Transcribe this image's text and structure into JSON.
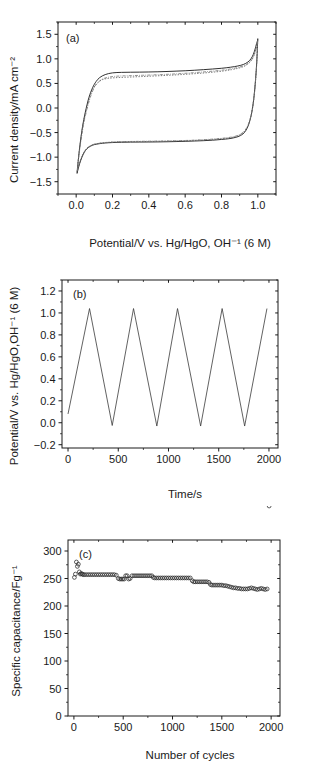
{
  "figure": {
    "background_color": "#ffffff",
    "line_color": "#1a1a1a"
  },
  "panels": [
    {
      "tag": "(a)",
      "id": "panel-a"
    },
    {
      "tag": "(b)",
      "id": "panel-b"
    },
    {
      "tag": "(c)",
      "id": "panel-c"
    }
  ],
  "chart_data": [
    {
      "type": "line",
      "panel": "(a)",
      "title": "",
      "xlabel": "Potential/V vs. Hg/HgO, OH⁻¹ (6 M)",
      "ylabel": "Current density/mA cm⁻²",
      "xlim": [
        -0.1,
        1.1
      ],
      "ylim": [
        -1.75,
        1.75
      ],
      "xticks": [
        0.0,
        0.2,
        0.4,
        0.6,
        0.8,
        1.0
      ],
      "xtick_labels": [
        "0.0",
        "0.2",
        "0.4",
        "0.6",
        "0.8",
        "1.0"
      ],
      "yticks": [
        -1.5,
        -1.0,
        -0.5,
        0.0,
        0.5,
        1.0,
        1.5
      ],
      "ytick_labels": [
        "−1.5",
        "−1.0",
        "−0.5",
        "0.0",
        "0.5",
        "1.0",
        "1.5"
      ],
      "grid": false,
      "legend": "none",
      "series": [
        {
          "name": "cv-cycle-1",
          "style": "solid",
          "upper_branch": {
            "x": [
              0.005,
              0.012,
              0.022,
              0.035,
              0.05,
              0.07,
              0.09,
              0.11,
              0.13,
              0.16,
              0.2,
              0.25,
              0.3,
              0.35,
              0.4,
              0.45,
              0.5,
              0.55,
              0.6,
              0.65,
              0.7,
              0.75,
              0.8,
              0.85,
              0.89,
              0.92,
              0.945,
              0.962,
              0.975,
              0.985,
              0.993,
              0.999
            ],
            "y": [
              -1.33,
              -1.05,
              -0.72,
              -0.38,
              -0.09,
              0.21,
              0.41,
              0.54,
              0.62,
              0.68,
              0.715,
              0.725,
              0.728,
              0.73,
              0.733,
              0.737,
              0.743,
              0.75,
              0.758,
              0.768,
              0.78,
              0.793,
              0.808,
              0.83,
              0.855,
              0.885,
              0.935,
              1.0,
              1.09,
              1.2,
              1.31,
              1.38
            ]
          },
          "lower_branch": {
            "x": [
              0.999,
              0.995,
              0.988,
              0.978,
              0.966,
              0.95,
              0.93,
              0.905,
              0.875,
              0.84,
              0.8,
              0.75,
              0.7,
              0.65,
              0.6,
              0.55,
              0.5,
              0.45,
              0.4,
              0.35,
              0.3,
              0.25,
              0.2,
              0.16,
              0.13,
              0.1,
              0.08,
              0.06,
              0.045,
              0.032,
              0.02,
              0.011,
              0.005
            ],
            "y": [
              1.38,
              1.0,
              0.6,
              0.2,
              -0.1,
              -0.33,
              -0.48,
              -0.56,
              -0.6,
              -0.625,
              -0.64,
              -0.655,
              -0.665,
              -0.672,
              -0.678,
              -0.683,
              -0.687,
              -0.69,
              -0.692,
              -0.693,
              -0.694,
              -0.697,
              -0.703,
              -0.712,
              -0.725,
              -0.745,
              -0.775,
              -0.825,
              -0.9,
              -1.0,
              -1.12,
              -1.24,
              -1.33
            ]
          }
        },
        {
          "name": "cv-cycle-2",
          "style": "dotted",
          "upper_branch": {
            "x": [
              0.005,
              0.013,
              0.024,
              0.038,
              0.055,
              0.075,
              0.095,
              0.115,
              0.14,
              0.17,
              0.21,
              0.26,
              0.31,
              0.36,
              0.41,
              0.46,
              0.51,
              0.56,
              0.61,
              0.66,
              0.71,
              0.76,
              0.81,
              0.855,
              0.893,
              0.923,
              0.947,
              0.964,
              0.977,
              0.986,
              0.994,
              0.999
            ],
            "y": [
              -1.3,
              -1.0,
              -0.68,
              -0.34,
              -0.05,
              0.22,
              0.4,
              0.5,
              0.57,
              0.6,
              0.615,
              0.625,
              0.632,
              0.64,
              0.648,
              0.657,
              0.666,
              0.676,
              0.688,
              0.7,
              0.715,
              0.732,
              0.752,
              0.78,
              0.81,
              0.845,
              0.9,
              0.965,
              1.05,
              1.15,
              1.26,
              1.35
            ]
          },
          "lower_branch": {
            "x": [
              0.999,
              0.995,
              0.988,
              0.978,
              0.966,
              0.95,
              0.93,
              0.905,
              0.875,
              0.84,
              0.8,
              0.75,
              0.7,
              0.65,
              0.6,
              0.55,
              0.5,
              0.45,
              0.4,
              0.35,
              0.3,
              0.25,
              0.2,
              0.16,
              0.13,
              0.1,
              0.08,
              0.06,
              0.045,
              0.032,
              0.02,
              0.011,
              0.005
            ],
            "y": [
              1.35,
              0.98,
              0.58,
              0.19,
              -0.1,
              -0.32,
              -0.46,
              -0.54,
              -0.585,
              -0.61,
              -0.625,
              -0.64,
              -0.652,
              -0.66,
              -0.666,
              -0.671,
              -0.675,
              -0.678,
              -0.68,
              -0.682,
              -0.684,
              -0.688,
              -0.695,
              -0.705,
              -0.718,
              -0.738,
              -0.768,
              -0.818,
              -0.89,
              -0.985,
              -1.1,
              -1.22,
              -1.3
            ]
          }
        },
        {
          "name": "cv-cycle-3",
          "style": "dash-dot",
          "upper_branch": {
            "x": [
              0.006,
              0.015,
              0.027,
              0.042,
              0.06,
              0.08,
              0.1,
              0.12,
              0.145,
              0.175,
              0.215,
              0.265,
              0.315,
              0.365,
              0.415,
              0.465,
              0.515,
              0.565,
              0.615,
              0.665,
              0.715,
              0.765,
              0.815,
              0.86,
              0.897,
              0.926,
              0.949,
              0.966,
              0.978,
              0.987,
              0.994,
              0.999
            ],
            "y": [
              -1.28,
              -0.97,
              -0.65,
              -0.31,
              -0.02,
              0.24,
              0.42,
              0.52,
              0.59,
              0.625,
              0.645,
              0.655,
              0.66,
              0.666,
              0.672,
              0.68,
              0.688,
              0.698,
              0.71,
              0.723,
              0.738,
              0.755,
              0.775,
              0.802,
              0.832,
              0.866,
              0.918,
              0.982,
              1.07,
              1.17,
              1.28,
              1.36
            ]
          },
          "lower_branch": {
            "x": [
              0.999,
              0.995,
              0.988,
              0.978,
              0.966,
              0.95,
              0.93,
              0.905,
              0.875,
              0.84,
              0.8,
              0.75,
              0.7,
              0.65,
              0.6,
              0.55,
              0.5,
              0.45,
              0.4,
              0.35,
              0.3,
              0.25,
              0.2,
              0.16,
              0.13,
              0.1,
              0.08,
              0.06,
              0.045,
              0.032,
              0.02,
              0.011,
              0.006
            ],
            "y": [
              1.36,
              0.99,
              0.59,
              0.2,
              -0.09,
              -0.31,
              -0.45,
              -0.53,
              -0.575,
              -0.6,
              -0.617,
              -0.633,
              -0.645,
              -0.654,
              -0.661,
              -0.666,
              -0.67,
              -0.673,
              -0.676,
              -0.678,
              -0.681,
              -0.685,
              -0.692,
              -0.702,
              -0.715,
              -0.735,
              -0.765,
              -0.815,
              -0.888,
              -0.982,
              -1.1,
              -1.21,
              -1.28
            ]
          }
        }
      ]
    },
    {
      "type": "line",
      "panel": "(b)",
      "title": "",
      "xlabel": "Time/s",
      "ylabel": "Potential/V vs. Hg/HgO,OH⁻¹ (6 M)",
      "xlim": [
        -60,
        2090
      ],
      "ylim": [
        -0.23,
        1.3
      ],
      "xticks": [
        0,
        500,
        1000,
        1500,
        2000
      ],
      "xtick_labels": [
        "0",
        "500",
        "1000",
        "1500",
        "2000"
      ],
      "yticks": [
        -0.2,
        0.0,
        0.2,
        0.4,
        0.6,
        0.8,
        1.0,
        1.2
      ],
      "ytick_labels": [
        "−0.2",
        "0.0",
        "0.2",
        "0.4",
        "0.6",
        "0.8",
        "1.0",
        "1.2"
      ],
      "grid": false,
      "legend": "none",
      "series": [
        {
          "name": "galvanostatic-charge-discharge",
          "style": "solid",
          "x": [
            0,
            214,
            440,
            652,
            884,
            1090,
            1320,
            1534,
            1758,
            1980
          ],
          "y": [
            0.08,
            1.04,
            -0.025,
            1.04,
            -0.03,
            1.04,
            -0.03,
            1.04,
            -0.03,
            1.04
          ],
          "description": "Triangular charge-discharge cycles; charge ramp ~214 s, discharge ~226 s"
        }
      ]
    },
    {
      "type": "scatter",
      "panel": "(c)",
      "title": "",
      "xlabel": "Number of cycles",
      "ylabel": "Specific capacitance/Fg⁻¹",
      "xlim": [
        -60,
        2090
      ],
      "ylim": [
        0,
        320
      ],
      "xticks": [
        0,
        500,
        1000,
        1500,
        2000
      ],
      "xtick_labels": [
        "0",
        "500",
        "1000",
        "1500",
        "2000"
      ],
      "yticks": [
        0,
        50,
        100,
        150,
        200,
        250,
        300
      ],
      "ytick_labels": [
        "0",
        "50",
        "100",
        "150",
        "200",
        "250",
        "300"
      ],
      "grid": false,
      "legend": "none",
      "marker": "open-circle",
      "series": [
        {
          "name": "specific-capacitance-vs-cycles",
          "x": [
            5,
            15,
            25,
            35,
            45,
            55,
            65,
            75,
            85,
            95,
            110,
            130,
            150,
            170,
            190,
            210,
            230,
            250,
            270,
            290,
            310,
            330,
            350,
            370,
            390,
            410,
            430,
            450,
            465,
            480,
            495,
            510,
            525,
            540,
            555,
            570,
            590,
            610,
            630,
            650,
            670,
            690,
            710,
            730,
            750,
            770,
            790,
            805,
            820,
            840,
            860,
            880,
            900,
            920,
            940,
            960,
            980,
            1000,
            1020,
            1040,
            1060,
            1080,
            1100,
            1120,
            1140,
            1160,
            1180,
            1200,
            1215,
            1230,
            1250,
            1270,
            1290,
            1310,
            1330,
            1350,
            1370,
            1385,
            1400,
            1420,
            1440,
            1460,
            1480,
            1500,
            1520,
            1540,
            1560,
            1580,
            1600,
            1620,
            1640,
            1660,
            1680,
            1700,
            1720,
            1740,
            1760,
            1780,
            1800,
            1820,
            1840,
            1860,
            1880,
            1900,
            1920,
            1940,
            1960,
            1980
          ],
          "y": [
            252,
            258,
            280,
            272,
            276,
            262,
            258,
            259,
            258,
            257,
            257,
            257,
            257,
            257,
            257,
            257,
            257,
            257,
            257,
            257,
            257,
            257,
            257,
            257,
            257,
            257,
            256,
            250,
            249,
            249,
            249,
            249,
            255,
            255,
            249,
            250,
            255,
            255,
            255,
            255,
            255,
            255,
            255,
            255,
            255,
            255,
            255,
            252,
            251,
            251,
            251,
            251,
            251,
            251,
            251,
            251,
            251,
            251,
            251,
            251,
            251,
            251,
            251,
            251,
            251,
            251,
            251,
            246,
            244,
            244,
            244,
            244,
            244,
            244,
            244,
            244,
            243,
            239,
            238,
            238,
            238,
            238,
            238,
            238,
            237,
            237,
            236,
            235,
            234,
            233,
            233,
            232,
            232,
            231,
            231,
            231,
            231,
            232,
            233,
            232,
            231,
            230,
            231,
            232,
            231,
            230,
            231
          ]
        }
      ]
    }
  ]
}
